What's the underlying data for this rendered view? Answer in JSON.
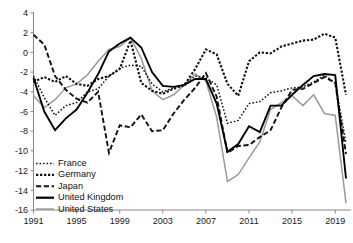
{
  "chart_data": {
    "type": "line",
    "title": "",
    "subtitle": "",
    "xlabel": "",
    "ylabel": "",
    "xlim": [
      1991,
      2020
    ],
    "ylim": [
      -16,
      4
    ],
    "grid": false,
    "legend_position": "bottom-left",
    "x": [
      1991,
      1992,
      1993,
      1994,
      1995,
      1996,
      1997,
      1998,
      1999,
      2000,
      2001,
      2002,
      2003,
      2004,
      2005,
      2006,
      2007,
      2008,
      2009,
      2010,
      2011,
      2012,
      2013,
      2014,
      2015,
      2016,
      2017,
      2018,
      2019,
      2020
    ],
    "y_ticks": [
      4,
      2,
      0,
      -2,
      -4,
      -6,
      -8,
      -10,
      -12,
      -14,
      -16
    ],
    "y_tick_labels": [
      "4",
      "2",
      "0",
      "-2",
      "-4",
      "-6",
      "-8",
      "-10",
      "-12",
      "-14",
      "-16"
    ],
    "x_ticks": [
      1991,
      1995,
      1999,
      2003,
      2007,
      2011,
      2015,
      2019
    ],
    "x_tick_labels": [
      "1991",
      "1995",
      "1999",
      "2003",
      "2007",
      "2011",
      "2015",
      "2019"
    ],
    "series": [
      {
        "name": "France",
        "style": "fine-dotted",
        "color": "#111111",
        "values": [
          -2.4,
          -4.6,
          -6.4,
          -5.4,
          -5.1,
          -4.0,
          -3.7,
          -2.4,
          -1.6,
          -1.3,
          -1.4,
          -3.2,
          -4.0,
          -3.6,
          -3.4,
          -2.4,
          -2.6,
          -3.3,
          -7.2,
          -6.9,
          -5.2,
          -5.0,
          -4.1,
          -3.9,
          -3.6,
          -3.5,
          -3.0,
          -2.3,
          -3.1,
          -9.2
        ]
      },
      {
        "name": "Germany",
        "style": "dotted",
        "color": "#111111",
        "values": [
          -3.0,
          -2.5,
          -3.0,
          -2.4,
          -3.2,
          -3.4,
          -2.7,
          -2.4,
          -1.7,
          1.2,
          -3.1,
          -3.9,
          -4.2,
          -3.7,
          -3.3,
          -1.7,
          0.3,
          -0.2,
          -3.2,
          -4.4,
          -0.9,
          0.0,
          -0.1,
          0.6,
          0.9,
          1.2,
          1.3,
          1.9,
          1.5,
          -4.3
        ]
      },
      {
        "name": "Japan",
        "style": "dash-dot",
        "color": "#111111",
        "values": [
          1.8,
          0.8,
          -2.4,
          -3.8,
          -4.7,
          -5.1,
          -4.0,
          -10.2,
          -7.4,
          -7.6,
          -6.3,
          -8.0,
          -7.9,
          -6.2,
          -4.8,
          -3.6,
          -2.1,
          -4.5,
          -10.2,
          -9.5,
          -9.4,
          -8.6,
          -7.9,
          -5.6,
          -3.8,
          -3.7,
          -3.1,
          -2.5,
          -3.1,
          -10.3
        ]
      },
      {
        "name": "United Kingdom",
        "style": "solid",
        "color": "#000000",
        "values": [
          -2.6,
          -6.0,
          -7.9,
          -6.7,
          -5.8,
          -4.1,
          -2.2,
          0.1,
          0.9,
          1.5,
          0.5,
          -2.0,
          -3.4,
          -3.5,
          -3.3,
          -2.7,
          -2.7,
          -5.2,
          -10.1,
          -9.3,
          -7.5,
          -8.1,
          -5.4,
          -5.4,
          -4.3,
          -3.3,
          -2.4,
          -2.2,
          -2.3,
          -12.8
        ]
      },
      {
        "name": "United States",
        "style": "solid-gray",
        "color": "#9a9a9a",
        "values": [
          -4.4,
          -5.6,
          -4.8,
          -3.6,
          -3.2,
          -2.3,
          -0.9,
          0.3,
          0.6,
          1.5,
          -0.6,
          -3.9,
          -4.8,
          -4.3,
          -3.3,
          -2.2,
          -2.9,
          -6.6,
          -13.1,
          -12.4,
          -10.7,
          -9.1,
          -5.8,
          -5.1,
          -4.4,
          -5.4,
          -4.3,
          -6.2,
          -6.4,
          -15.3
        ]
      }
    ]
  },
  "legend": {
    "items": [
      {
        "label": "France"
      },
      {
        "label": "Germany"
      },
      {
        "label": "Japan"
      },
      {
        "label": "United Kingdom"
      },
      {
        "label": "United States"
      }
    ]
  }
}
